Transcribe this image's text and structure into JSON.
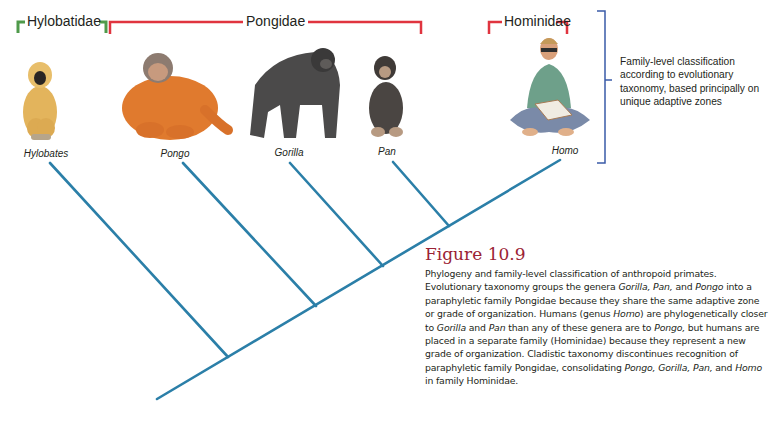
{
  "families": {
    "hylobatidae": {
      "label": "Hylobatidae",
      "bracket_color": "#4f9a4a"
    },
    "pongidae": {
      "label": "Pongidae",
      "bracket_color": "#e0343f"
    },
    "hominidae": {
      "label": "Hominidae",
      "bracket_color": "#e0343f"
    }
  },
  "genera": [
    {
      "name": "Hylobates",
      "icon": "gibbon-illustration"
    },
    {
      "name": "Pongo",
      "icon": "orangutan-illustration"
    },
    {
      "name": "Gorilla",
      "icon": "gorilla-illustration"
    },
    {
      "name": "Pan",
      "icon": "chimpanzee-illustration"
    },
    {
      "name": "Homo",
      "icon": "human-reading-illustration"
    }
  ],
  "side_note": {
    "text": "Family-level classification according to evolutionary taxonomy, based principally on unique adaptive zones",
    "bracket_color": "#3a5ba8"
  },
  "tree": {
    "line_color": "#2b7fa8"
  },
  "caption": {
    "title": "Figure 10.9",
    "title_color": "#9b2335",
    "segments": [
      {
        "t": "Phylogeny and family-level classification of anthropoid primates. Evolutionary taxonomy groups the genera ",
        "i": false
      },
      {
        "t": "Gorilla, Pan,",
        "i": true
      },
      {
        "t": " and ",
        "i": false
      },
      {
        "t": "Pongo",
        "i": true
      },
      {
        "t": " into a paraphyletic family Pongidae because they share the same adaptive zone or grade of organization. Humans (genus ",
        "i": false
      },
      {
        "t": "Homo",
        "i": true
      },
      {
        "t": ") are phylogenetically closer to ",
        "i": false
      },
      {
        "t": "Gorilla",
        "i": true
      },
      {
        "t": " and ",
        "i": false
      },
      {
        "t": "Pan",
        "i": true
      },
      {
        "t": " than any of these genera are to ",
        "i": false
      },
      {
        "t": "Pongo,",
        "i": true
      },
      {
        "t": " but humans are placed in a separate family (Hominidae) because they represent a new grade of organization. Cladistic taxonomy discontinues recognition of paraphyletic family Pongidae, consolidating ",
        "i": false
      },
      {
        "t": "Pongo, Gorilla, Pan,",
        "i": true
      },
      {
        "t": " and ",
        "i": false
      },
      {
        "t": "Homo",
        "i": true
      },
      {
        "t": " in family Hominidae.",
        "i": false
      }
    ]
  }
}
